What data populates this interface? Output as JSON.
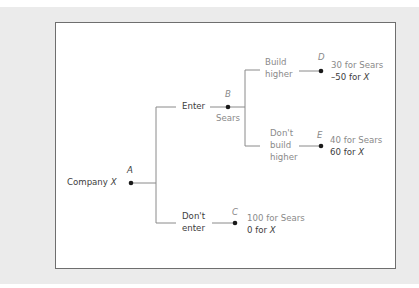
{
  "diagram": {
    "type": "game-tree",
    "colors": {
      "background": "#ebebeb",
      "panel": "#ffffff",
      "border": "#6e6e6e",
      "x_text": "#3c3c3c",
      "sears_text": "#8a8a8a",
      "line": "#8a8a8a",
      "node": "#1a1a1a"
    },
    "root": {
      "player_label": "Company",
      "player_var": "X",
      "node": "A"
    },
    "moves": {
      "enter": "Enter",
      "dont_enter_1": "Don't",
      "dont_enter_2": "enter",
      "build_higher_1": "Build",
      "build_higher_2": "higher",
      "dont_build_1": "Don't",
      "dont_build_2": "build",
      "dont_build_3": "higher"
    },
    "nodes": {
      "B": {
        "label": "B",
        "player": "Sears"
      },
      "C": {
        "label": "C"
      },
      "D": {
        "label": "D"
      },
      "E": {
        "label": "E"
      }
    },
    "payoffs": {
      "D": {
        "sears": "30 for Sears",
        "x_num": "–50 for",
        "x_var": "X"
      },
      "E": {
        "sears": "40 for Sears",
        "x_num": "60 for",
        "x_var": "X"
      },
      "C": {
        "sears": "100 for Sears",
        "x_num": "0 for",
        "x_var": "X"
      }
    }
  }
}
